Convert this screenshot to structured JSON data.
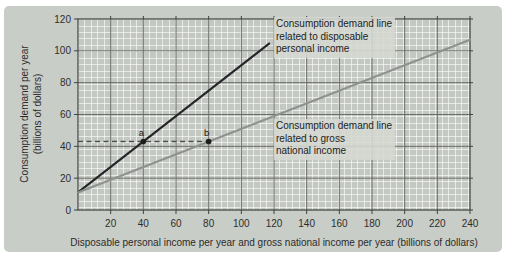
{
  "figure": {
    "y_axis_title": "Consumption demand per year\n(billions of dollars)",
    "x_axis_title": "Disposable personal income per year and gross national income per year (billions of dollars)"
  },
  "chart_data": {
    "type": "line",
    "title": "",
    "xlabel": "Disposable personal income per year and gross national income per year (billions of dollars)",
    "ylabel": "Consumption demand per year (billions of dollars)",
    "x_range": [
      0,
      240
    ],
    "y_range": [
      0,
      120
    ],
    "x_ticks": [
      20,
      40,
      60,
      80,
      100,
      120,
      140,
      160,
      180,
      200,
      220,
      240
    ],
    "y_ticks": [
      0,
      20,
      40,
      60,
      80,
      100,
      120
    ],
    "grid": true,
    "colors": {
      "panel_bg": "#c9cdc7",
      "plot_bg": "#c4c8c2",
      "major_grid": "#62655f",
      "axis_border": "#3f423e",
      "dpi_line": "#26262a",
      "gni_line": "#8f9290",
      "dashed_guide": "#4a4d49",
      "text": "#2d2d2d"
    },
    "series": [
      {
        "name": "Consumption demand line related to disposable personal income",
        "slope": 0.8,
        "intercept": 11,
        "points": [
          [
            0,
            11
          ],
          [
            117,
            104.6
          ]
        ]
      },
      {
        "name": "Consumption demand line related to gross national income",
        "slope": 0.4,
        "intercept": 11,
        "points": [
          [
            0,
            11
          ],
          [
            240,
            107
          ]
        ]
      }
    ],
    "marked_points": [
      {
        "label": "a",
        "x": 40,
        "y": 43
      },
      {
        "label": "b",
        "x": 80,
        "y": 43
      }
    ],
    "dashed_guide": {
      "y": 43,
      "x_from": 0,
      "x_to": 80
    },
    "annotations": [
      {
        "id": "label-dpi",
        "text": "Consumption demand line\nrelated to disposable\npersonal income"
      },
      {
        "id": "label-gni",
        "text": "Consumption demand line\nrelated to gross\nnational income"
      }
    ]
  }
}
